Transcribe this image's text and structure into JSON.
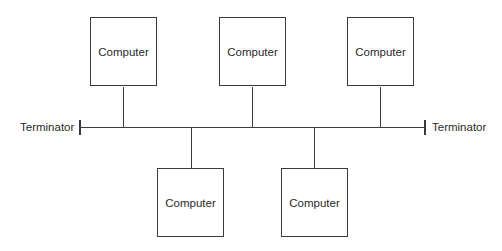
{
  "diagram": {
    "nodes": [
      {
        "id": "computer-1",
        "label": "Computer",
        "position": "top"
      },
      {
        "id": "computer-2",
        "label": "Computer",
        "position": "top"
      },
      {
        "id": "computer-3",
        "label": "Computer",
        "position": "top"
      },
      {
        "id": "computer-4",
        "label": "Computer",
        "position": "bottom"
      },
      {
        "id": "computer-5",
        "label": "Computer",
        "position": "bottom"
      }
    ],
    "terminators": [
      {
        "id": "terminator-left",
        "label": "Terminator"
      },
      {
        "id": "terminator-right",
        "label": "Terminator"
      }
    ],
    "bus": {
      "label": ""
    },
    "line_color": "#3a3a3a"
  }
}
